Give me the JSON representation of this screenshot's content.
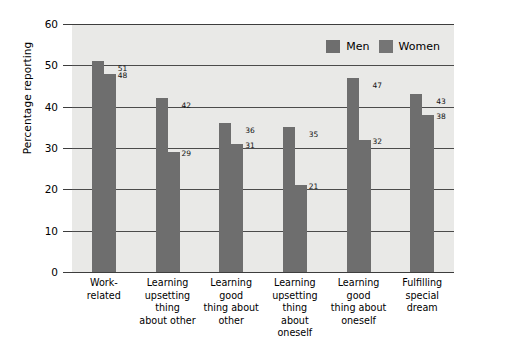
{
  "chart_data": {
    "type": "bar",
    "title": "",
    "xlabel": "",
    "ylabel": "Percentage reporting",
    "ylim": [
      0,
      60
    ],
    "yticks": [
      0,
      10,
      20,
      30,
      40,
      50,
      60
    ],
    "grid": true,
    "legend_position": "top-right",
    "categories": [
      "Work- related",
      "Learning upsetting thing about other",
      "Learning good thing about other",
      "Learning upsetting thing about oneself",
      "Learning good thing about oneself",
      "Fulfilling special dream"
    ],
    "category_lines": [
      [
        "Work- related"
      ],
      [
        "Learning",
        "upsetting thing",
        "about other"
      ],
      [
        "Learning good",
        "thing about",
        "other"
      ],
      [
        "Learning",
        "upsetting thing",
        "about oneself"
      ],
      [
        "Learning good",
        "thing about",
        "oneself"
      ],
      [
        "Fulfilling special",
        "dream"
      ]
    ],
    "series": [
      {
        "name": "Men",
        "color": "#6e6e6e",
        "values": [
          51,
          42,
          36,
          35,
          47,
          43
        ]
      },
      {
        "name": "Women",
        "color": "#6e6e6e",
        "values": [
          48,
          29,
          31,
          21,
          32,
          38
        ]
      }
    ]
  },
  "legend": {
    "men_label": "Men",
    "women_label": "Women"
  },
  "axis": {
    "y_title": "Percentage reporting",
    "y_ticks": [
      "60",
      "50",
      "40",
      "30",
      "20",
      "10",
      "0"
    ]
  }
}
